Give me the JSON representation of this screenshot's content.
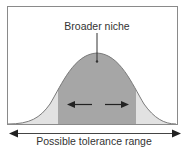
{
  "diagram": {
    "niche_label": "Broader niche",
    "axis_label": "Possible tolerance range",
    "colors": {
      "background": "#ffffff",
      "frame": "#8a8a8a",
      "curve_outline": "#7a7a7a",
      "tail_fill": "#e2e2e2",
      "niche_fill": "#a6a6a6",
      "arrow": "#222222"
    },
    "elements": [
      {
        "type": "bell-curve",
        "description": "Normal distribution curve of tolerance"
      },
      {
        "type": "shaded-band",
        "description": "Broader niche region (central dark band)"
      },
      {
        "type": "double-arrow",
        "description": "Expansion arrows pointing outward within niche"
      },
      {
        "type": "axis-arrow",
        "description": "Bidirectional arrow for possible tolerance range"
      }
    ]
  }
}
